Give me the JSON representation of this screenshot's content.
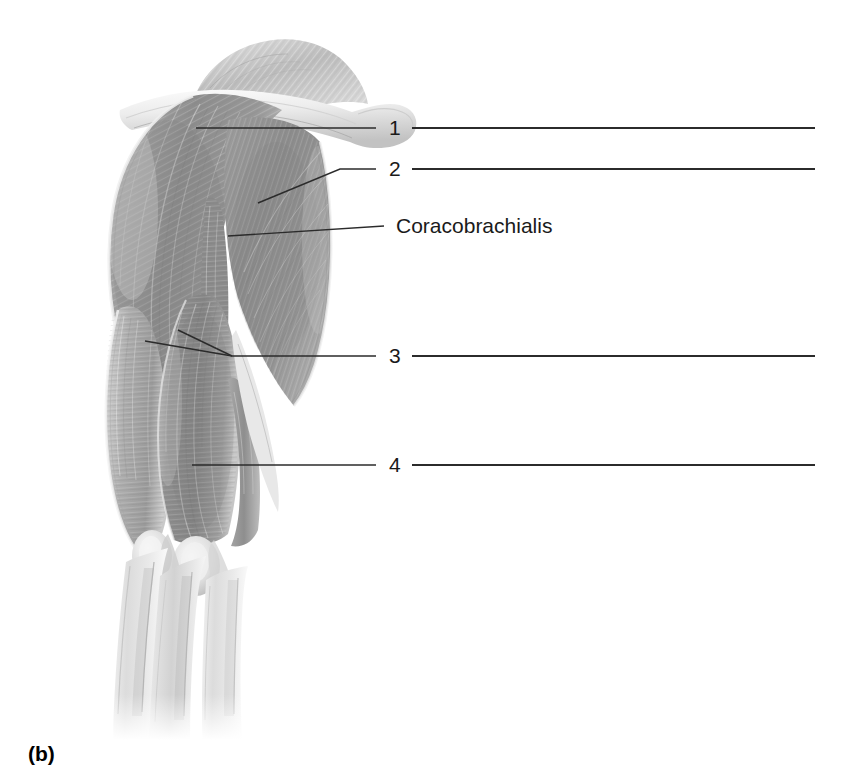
{
  "figure": {
    "caption": "(b)",
    "view_label": "(b)"
  },
  "labels": [
    {
      "id": "label-1",
      "text": "1",
      "type": "numbered-blank",
      "x": 388,
      "y": 128,
      "leader": {
        "from_x": 196,
        "from_y": 128,
        "to_x": 376,
        "to_y": 128,
        "kind": "straight"
      },
      "answer_line": {
        "x1": 412,
        "y1": 128,
        "x2": 815,
        "y2": 128
      }
    },
    {
      "id": "label-2",
      "text": "2",
      "type": "numbered-blank",
      "x": 388,
      "y": 169,
      "leader": {
        "from_x": 258,
        "from_y": 203,
        "to_x": 376,
        "to_y": 169,
        "kind": "elbow",
        "bend_x": 340,
        "bend_y": 169
      },
      "answer_line": {
        "x1": 412,
        "y1": 169,
        "x2": 815,
        "y2": 169
      }
    },
    {
      "id": "label-coracobrachialis",
      "text": "Coracobrachialis",
      "type": "named",
      "x": 396,
      "y": 226,
      "leader": {
        "from_x": 228,
        "from_y": 236,
        "to_x": 384,
        "to_y": 226,
        "kind": "straight"
      },
      "answer_line": null
    },
    {
      "id": "label-3",
      "text": "3",
      "type": "numbered-blank",
      "x": 388,
      "y": 356,
      "leader": {
        "from_x": 145,
        "from_y": 341,
        "to_x": 376,
        "to_y": 356,
        "kind": "fork",
        "second_from_x": 178,
        "second_from_y": 330,
        "junction_x": 232,
        "junction_y": 356
      },
      "answer_line": {
        "x1": 412,
        "y1": 356,
        "x2": 815,
        "y2": 356
      }
    },
    {
      "id": "label-4",
      "text": "4",
      "type": "numbered-blank",
      "x": 388,
      "y": 465,
      "leader": {
        "from_x": 192,
        "from_y": 465,
        "to_x": 376,
        "to_y": 465,
        "kind": "straight"
      },
      "answer_line": {
        "x1": 412,
        "y1": 465,
        "x2": 815,
        "y2": 465
      }
    }
  ],
  "colors": {
    "background": "#ffffff",
    "line": "#2b2b2b",
    "text": "#1a1a1a",
    "muscle_dark": "#7e7e7e",
    "muscle_mid": "#9a9a9a",
    "muscle_light": "#c4c4c4",
    "muscle_pale": "#e2e2e2",
    "highlight": "#f4f4f4"
  }
}
